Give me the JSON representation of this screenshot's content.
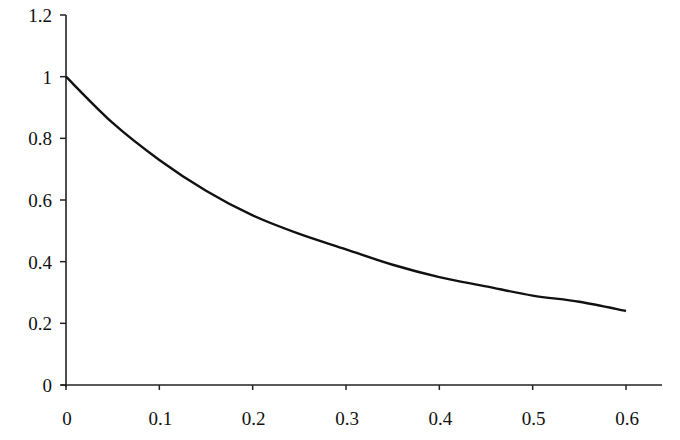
{
  "chart_data": {
    "type": "line",
    "title": "",
    "xlabel": "",
    "ylabel": "",
    "xlim": [
      0,
      0.6
    ],
    "ylim": [
      0,
      1.2
    ],
    "grid": false,
    "legend": null,
    "x_ticks": [
      "0",
      "0.1",
      "0.2",
      "0.3",
      "0.4",
      "0.5",
      "0.6"
    ],
    "y_ticks": [
      "0",
      "0.2",
      "0.4",
      "0.6",
      "0.8",
      "1",
      "1.2"
    ],
    "series": [
      {
        "name": "curve",
        "color": "#111111",
        "x": [
          0,
          0.05,
          0.1,
          0.15,
          0.2,
          0.25,
          0.3,
          0.35,
          0.4,
          0.45,
          0.5,
          0.55,
          0.6
        ],
        "values": [
          1.0,
          0.85,
          0.73,
          0.63,
          0.55,
          0.49,
          0.44,
          0.39,
          0.35,
          0.32,
          0.29,
          0.27,
          0.24
        ]
      }
    ]
  }
}
